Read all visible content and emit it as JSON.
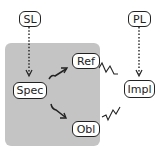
{
  "diagram": {
    "nodes": {
      "sl": "SL",
      "pl": "PL",
      "ref": "Ref",
      "spec": "Spec",
      "obl": "Obl",
      "impl": "Impl"
    },
    "edges": [
      {
        "from": "SL",
        "to": "Spec",
        "style": "dotted-arrow"
      },
      {
        "from": "PL",
        "to": "Impl",
        "style": "dotted-arrow"
      },
      {
        "from": "Spec",
        "to": "Ref",
        "style": "solid-arrow"
      },
      {
        "from": "Spec",
        "to": "Obl",
        "style": "solid-arrow"
      },
      {
        "from": "Ref",
        "to": "Impl",
        "style": "squiggle"
      },
      {
        "from": "Obl",
        "to": "Impl",
        "style": "squiggle"
      }
    ],
    "colors": {
      "region": "#c4c4c4",
      "stroke": "#222222",
      "node_fill": "#ffffff"
    }
  }
}
